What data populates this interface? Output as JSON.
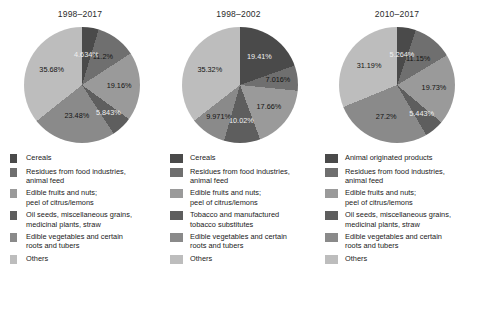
{
  "chart_data": [
    {
      "type": "pie",
      "title": "1998–2017",
      "categories": [
        "Cereals",
        "Residues from food industries,\nanimal feed",
        "Edible fruits and nuts;\npeel of citrus/lemons",
        "Oil seeds, miscellaneous grains,\nmedicinal plants, straw",
        "Edible vegetables and certain\nroots and tubers",
        "Others"
      ],
      "values": [
        4.634,
        11.2,
        19.16,
        5.843,
        23.48,
        35.68
      ],
      "labels": [
        "4.634%",
        "11.2%",
        "19.16%",
        "5.843%",
        "23.48%",
        "35.68%"
      ],
      "colors": [
        "#4a4a4a",
        "#6f6f6f",
        "#9a9a9a",
        "#5e5e5e",
        "#8a8a8a",
        "#bdbdbd"
      ],
      "legend_position": "bottom",
      "grid": false
    },
    {
      "type": "pie",
      "title": "1998–2002",
      "categories": [
        "Cereals",
        "Residues from food industries,\nanimal feed",
        "Edible fruits and nuts;\npeel of citrus/lemons",
        "Tobacco and manufactured\ntobacco substitutes",
        "Edible vegetables and certain\nroots and tubers",
        "Others"
      ],
      "values": [
        19.41,
        7.016,
        17.66,
        10.02,
        9.971,
        35.32
      ],
      "labels": [
        "19.41%",
        "7.016%",
        "17.66%",
        "10.02%",
        "9.971%",
        "35.32%"
      ],
      "colors": [
        "#4a4a4a",
        "#6f6f6f",
        "#9a9a9a",
        "#5e5e5e",
        "#8a8a8a",
        "#bdbdbd"
      ],
      "legend_position": "bottom",
      "grid": false
    },
    {
      "type": "pie",
      "title": "2010–2017",
      "categories": [
        "Animal originated products",
        "Residues from food industries,\nanimal feed",
        "Edible fruits and nuts;\npeel of citrus/lemons",
        "Oil seeds, miscellaneous grains,\nmedicinal plants, straw",
        "Edible vegetables and certain\nroots and tubers",
        "Others"
      ],
      "values": [
        5.264,
        11.15,
        19.73,
        5.443,
        27.2,
        31.19
      ],
      "labels": [
        "5.264%",
        "11.15%",
        "19.73%",
        "5.443%",
        "27.2%",
        "31.19%"
      ],
      "colors": [
        "#4a4a4a",
        "#6f6f6f",
        "#9a9a9a",
        "#5e5e5e",
        "#8a8a8a",
        "#bdbdbd"
      ],
      "legend_position": "bottom",
      "grid": false
    }
  ]
}
